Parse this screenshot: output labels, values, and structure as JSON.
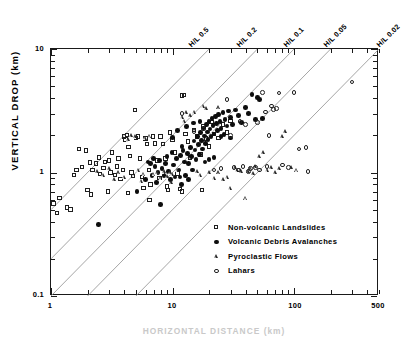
{
  "chart_data": {
    "type": "scatter",
    "title": "",
    "xlabel": "HORIZONTAL DISTANCE (km)",
    "ylabel": "VERTICAL DROP (km)",
    "xscale": "log",
    "yscale": "log",
    "xlim": [
      1,
      500
    ],
    "ylim": [
      0.1,
      10
    ],
    "grid": false,
    "xticks": [
      {
        "value": 1,
        "label": "1",
        "major": true
      },
      {
        "value": 10,
        "label": "10",
        "major": true
      },
      {
        "value": 100,
        "label": "100",
        "major": true
      },
      {
        "value": 500,
        "label": "500",
        "major": true
      }
    ],
    "yticks": [
      {
        "value": 10,
        "label": "10",
        "major": true
      },
      {
        "value": 1,
        "label": "1",
        "major": true
      },
      {
        "value": 0.1,
        "label": "0.1",
        "major": true
      }
    ],
    "reference_lines": {
      "name": "H/L ratio lines",
      "slope_loglog": 1,
      "items": [
        {
          "label": "H/L 0.5",
          "ratio": 0.5
        },
        {
          "label": "H/L 0.2",
          "ratio": 0.2
        },
        {
          "label": "H/L 0.1",
          "ratio": 0.1
        },
        {
          "label": "H/L 0.05",
          "ratio": 0.05
        },
        {
          "label": "H/L 0.02",
          "ratio": 0.02
        }
      ]
    },
    "legend": {
      "position": "lower-right-inside",
      "entries": [
        {
          "label": "Non-volcanic Landslides",
          "marker": "open-square"
        },
        {
          "label": "Volcanic Debris Avalanches",
          "marker": "filled-circle"
        },
        {
          "label": "Pyroclastic Flows",
          "marker": "open-triangle"
        },
        {
          "label": "Lahars",
          "marker": "open-circle"
        }
      ]
    },
    "series": [
      {
        "name": "Non-volcanic Landslides",
        "marker": "open-square",
        "points": [
          [
            1.05,
            0.56
          ],
          [
            1.12,
            0.47
          ],
          [
            1.18,
            0.62
          ],
          [
            1.35,
            0.52
          ],
          [
            1.45,
            0.5
          ],
          [
            1.55,
            0.95
          ],
          [
            1.62,
            1.05
          ],
          [
            1.7,
            1.55
          ],
          [
            1.8,
            1.1
          ],
          [
            1.95,
            1.5
          ],
          [
            2.0,
            0.72
          ],
          [
            2.1,
            1.2
          ],
          [
            2.2,
            1.05
          ],
          [
            2.35,
            1.18
          ],
          [
            2.5,
            1.32
          ],
          [
            2.55,
            0.97
          ],
          [
            2.7,
            1.08
          ],
          [
            2.8,
            1.22
          ],
          [
            2.95,
            0.7
          ],
          [
            3.0,
            1.25
          ],
          [
            3.1,
            1.0
          ],
          [
            3.2,
            1.45
          ],
          [
            3.35,
            0.95
          ],
          [
            3.5,
            1.12
          ],
          [
            3.6,
            1.3
          ],
          [
            3.75,
            0.88
          ],
          [
            3.9,
            1.05
          ],
          [
            4.0,
            1.95
          ],
          [
            4.1,
            1.85
          ],
          [
            4.25,
            2.0
          ],
          [
            4.35,
            1.6
          ],
          [
            4.5,
            1.35
          ],
          [
            4.6,
            1.0
          ],
          [
            4.75,
            0.93
          ],
          [
            4.9,
            3.2
          ],
          [
            5.0,
            1.9
          ],
          [
            5.2,
            1.95
          ],
          [
            5.4,
            1.3
          ],
          [
            5.6,
            0.92
          ],
          [
            5.8,
            0.75
          ],
          [
            6.0,
            1.88
          ],
          [
            6.2,
            1.7
          ],
          [
            6.4,
            1.05
          ],
          [
            6.6,
            0.8
          ],
          [
            6.9,
            1.95
          ],
          [
            7.2,
            1.72
          ],
          [
            7.5,
            1.25
          ],
          [
            7.8,
            0.9
          ],
          [
            8.0,
            1.95
          ],
          [
            8.4,
            1.7
          ],
          [
            8.8,
            1.3
          ],
          [
            9.0,
            0.77
          ],
          [
            9.5,
            2.1
          ],
          [
            10.0,
            1.85
          ],
          [
            10.5,
            1.45
          ],
          [
            11.0,
            0.98
          ],
          [
            11.5,
            0.73
          ],
          [
            12.0,
            4.2
          ],
          [
            12.4,
            4.25
          ],
          [
            12.8,
            2.05
          ],
          [
            13.5,
            1.78
          ],
          [
            14.0,
            1.32
          ],
          [
            15.0,
            2.2
          ],
          [
            16.0,
            1.95
          ],
          [
            17.0,
            1.4
          ],
          [
            18.0,
            2.35
          ],
          [
            19.0,
            1.88
          ],
          [
            20.0,
            1.62
          ],
          [
            21.0,
            2.55
          ],
          [
            22.0,
            2.05
          ],
          [
            24.0,
            1.9
          ],
          [
            26.0,
            2.45
          ],
          [
            28.0,
            2.1
          ],
          [
            30.0,
            2.6
          ],
          [
            12.0,
            0.7
          ],
          [
            9.2,
            0.72
          ],
          [
            2.15,
            0.66
          ],
          [
            6.5,
            0.6
          ],
          [
            4.3,
            0.68
          ],
          [
            17.5,
            0.72
          ]
        ]
      },
      {
        "name": "Volcanic Debris Avalanches",
        "marker": "filled-circle",
        "points": [
          [
            2.45,
            0.38
          ],
          [
            5.1,
            0.7
          ],
          [
            6.0,
            0.88
          ],
          [
            6.3,
            1.22
          ],
          [
            6.6,
            1.18
          ],
          [
            6.8,
            0.95
          ],
          [
            7.0,
            1.3
          ],
          [
            7.2,
            1.12
          ],
          [
            7.4,
            0.83
          ],
          [
            7.6,
            1.0
          ],
          [
            7.8,
            1.25
          ],
          [
            8.0,
            0.55
          ],
          [
            8.2,
            1.08
          ],
          [
            8.5,
            0.95
          ],
          [
            8.8,
            1.18
          ],
          [
            9.0,
            1.35
          ],
          [
            9.3,
            1.02
          ],
          [
            9.6,
            0.88
          ],
          [
            9.9,
            1.45
          ],
          [
            10.2,
            1.15
          ],
          [
            10.5,
            0.92
          ],
          [
            10.8,
            1.3
          ],
          [
            11.0,
            2.2
          ],
          [
            11.3,
            1.05
          ],
          [
            11.6,
            1.38
          ],
          [
            11.9,
            0.8
          ],
          [
            12.2,
            1.5
          ],
          [
            12.5,
            1.22
          ],
          [
            12.8,
            0.95
          ],
          [
            13.0,
            2.35
          ],
          [
            13.3,
            1.42
          ],
          [
            13.6,
            1.18
          ],
          [
            14.0,
            1.6
          ],
          [
            14.3,
            1.35
          ],
          [
            14.6,
            1.05
          ],
          [
            15.0,
            1.8
          ],
          [
            15.3,
            1.52
          ],
          [
            15.6,
            1.28
          ],
          [
            16.0,
            1.95
          ],
          [
            16.3,
            1.68
          ],
          [
            16.6,
            1.4
          ],
          [
            17.0,
            2.1
          ],
          [
            17.3,
            1.82
          ],
          [
            17.6,
            1.55
          ],
          [
            18.0,
            2.3
          ],
          [
            18.3,
            1.98
          ],
          [
            18.6,
            1.72
          ],
          [
            19.0,
            2.45
          ],
          [
            19.3,
            2.12
          ],
          [
            19.6,
            1.85
          ],
          [
            20.0,
            2.6
          ],
          [
            20.4,
            2.25
          ],
          [
            20.8,
            1.95
          ],
          [
            21.2,
            2.75
          ],
          [
            21.6,
            2.4
          ],
          [
            22.0,
            2.05
          ],
          [
            22.5,
            2.85
          ],
          [
            23.0,
            2.5
          ],
          [
            23.5,
            2.18
          ],
          [
            24.0,
            2.95
          ],
          [
            24.5,
            2.6
          ],
          [
            25.0,
            2.28
          ],
          [
            26.0,
            3.05
          ],
          [
            27.0,
            2.7
          ],
          [
            28.0,
            2.38
          ],
          [
            29.0,
            3.15
          ],
          [
            30.0,
            2.8
          ],
          [
            31.0,
            2.45
          ],
          [
            33.0,
            3.2
          ],
          [
            35.0,
            2.88
          ],
          [
            37.0,
            2.55
          ],
          [
            40.0,
            3.35
          ],
          [
            42.0,
            3.0
          ],
          [
            45.0,
            4.3
          ],
          [
            48.0,
            2.7
          ],
          [
            50.0,
            4.05
          ],
          [
            52.0,
            3.9
          ],
          [
            55.0,
            2.75
          ],
          [
            14.8,
            2.52
          ],
          [
            16.8,
            2.58
          ],
          [
            20.0,
            1.28
          ],
          [
            22.0,
            1.32
          ],
          [
            12.0,
            1.62
          ],
          [
            13.5,
            0.88
          ],
          [
            10.0,
            1.92
          ],
          [
            18.5,
            1.22
          ],
          [
            25.0,
            1.95
          ],
          [
            26.5,
            2.02
          ],
          [
            30.0,
            1.9
          ],
          [
            11.5,
            0.92
          ]
        ]
      },
      {
        "name": "Pyroclastic Flows",
        "marker": "open-triangle",
        "points": [
          [
            2.4,
            1.02
          ],
          [
            2.7,
            0.95
          ],
          [
            3.0,
            1.08
          ],
          [
            3.3,
            0.88
          ],
          [
            3.6,
            1.0
          ],
          [
            4.0,
            0.92
          ],
          [
            4.3,
            1.85
          ],
          [
            4.6,
            2.0
          ],
          [
            4.9,
            1.95
          ],
          [
            5.2,
            1.05
          ],
          [
            5.5,
            0.85
          ],
          [
            6.0,
            1.9
          ],
          [
            6.5,
            1.98
          ],
          [
            7.0,
            0.97
          ],
          [
            7.5,
            1.0
          ],
          [
            8.0,
            0.9
          ],
          [
            8.5,
            1.02
          ],
          [
            9.0,
            0.93
          ],
          [
            9.5,
            1.0
          ],
          [
            10.0,
            0.97
          ],
          [
            11.0,
            1.05
          ],
          [
            12.0,
            2.8
          ],
          [
            13.0,
            3.05
          ],
          [
            14.0,
            2.9
          ],
          [
            15.0,
            3.1
          ],
          [
            16.0,
            1.02
          ],
          [
            17.0,
            0.95
          ],
          [
            18.0,
            3.45
          ],
          [
            19.0,
            3.3
          ],
          [
            20.0,
            1.0
          ],
          [
            22.0,
            0.9
          ],
          [
            24.0,
            1.0
          ],
          [
            26.0,
            0.88
          ],
          [
            28.0,
            0.92
          ],
          [
            30.0,
            0.75
          ],
          [
            33.0,
            1.1
          ],
          [
            36.0,
            1.05
          ],
          [
            40.0,
            0.62
          ],
          [
            44.0,
            1.08
          ],
          [
            48.0,
            1.12
          ],
          [
            52.0,
            1.35
          ],
          [
            56.0,
            1.45
          ],
          [
            60.0,
            1.05
          ],
          [
            65.0,
            1.1
          ],
          [
            70.0,
            1.0
          ],
          [
            75.0,
            1.08
          ],
          [
            80.0,
            1.95
          ],
          [
            85.0,
            2.15
          ],
          [
            95.0,
            1.1
          ],
          [
            105.0,
            1.05
          ],
          [
            42.0,
            1.02
          ],
          [
            46.0,
            0.98
          ],
          [
            34.0,
            1.05
          ],
          [
            36.5,
            1.02
          ],
          [
            24.0,
            3.35
          ],
          [
            12.5,
            2.6
          ],
          [
            9.8,
            0.83
          ],
          [
            5.8,
            0.97
          ]
        ]
      },
      {
        "name": "Lahars",
        "marker": "open-circle",
        "points": [
          [
            12.0,
            3.0
          ],
          [
            15.0,
            2.15
          ],
          [
            18.0,
            2.25
          ],
          [
            28.0,
            3.9
          ],
          [
            32.0,
            1.1
          ],
          [
            35.0,
            1.05
          ],
          [
            38.0,
            1.12
          ],
          [
            40.0,
            2.45
          ],
          [
            44.0,
            1.08
          ],
          [
            48.0,
            1.1
          ],
          [
            52.0,
            1.05
          ],
          [
            55.0,
            4.45
          ],
          [
            58.0,
            3.1
          ],
          [
            60.0,
            1.12
          ],
          [
            65.0,
            3.45
          ],
          [
            68.0,
            3.25
          ],
          [
            72.0,
            3.3
          ],
          [
            75.0,
            4.4
          ],
          [
            80.0,
            1.15
          ],
          [
            90.0,
            1.1
          ],
          [
            100.0,
            4.45
          ],
          [
            110.0,
            1.55
          ],
          [
            125.0,
            1.6
          ],
          [
            130.0,
            1.02
          ],
          [
            300.0,
            5.4
          ],
          [
            22.0,
            1.05
          ],
          [
            25.0,
            1.08
          ],
          [
            30.0,
            2.0
          ],
          [
            42.0,
            1.02
          ],
          [
            36.0,
            2.6
          ],
          [
            50.0,
            2.55
          ],
          [
            62.0,
            2.0
          ]
        ]
      }
    ]
  }
}
